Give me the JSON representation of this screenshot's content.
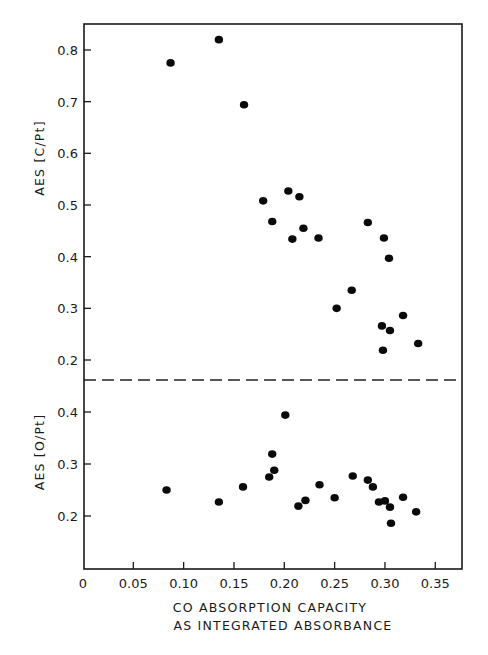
{
  "chart_data": {
    "type": "scatter",
    "layout": "two stacked panels sharing x-axis, separated by a dashed horizontal line",
    "grid": false,
    "legend": null,
    "x_axis": {
      "label_line1": "CO ABSORPTION CAPACITY",
      "label_line2": "AS INTEGRATED ABSORBANCE",
      "xlim": [
        0,
        0.378
      ],
      "ticks": [
        0,
        0.05,
        0.1,
        0.15,
        0.2,
        0.25,
        0.3,
        0.35
      ],
      "tick_labels": [
        "0",
        "0.05",
        "0.10",
        "0.15",
        "0.20",
        "0.25",
        "0.30",
        "0.35"
      ]
    },
    "panels": [
      {
        "name": "upper",
        "ylabel": "AES [C/Pt]",
        "ylim": [
          0.16,
          0.85
        ],
        "ticks": [
          0.2,
          0.3,
          0.4,
          0.5,
          0.6,
          0.7,
          0.8
        ],
        "tick_labels": [
          "0.2",
          "0.3",
          "0.4",
          "0.5",
          "0.6",
          "0.7",
          "0.8"
        ],
        "points": [
          [
            0.087,
            0.775
          ],
          [
            0.135,
            0.82
          ],
          [
            0.16,
            0.694
          ],
          [
            0.179,
            0.508
          ],
          [
            0.188,
            0.468
          ],
          [
            0.204,
            0.527
          ],
          [
            0.208,
            0.434
          ],
          [
            0.215,
            0.516
          ],
          [
            0.219,
            0.455
          ],
          [
            0.234,
            0.436
          ],
          [
            0.252,
            0.3
          ],
          [
            0.267,
            0.335
          ],
          [
            0.283,
            0.466
          ],
          [
            0.297,
            0.266
          ],
          [
            0.298,
            0.219
          ],
          [
            0.299,
            0.436
          ],
          [
            0.304,
            0.397
          ],
          [
            0.305,
            0.257
          ],
          [
            0.318,
            0.286
          ],
          [
            0.333,
            0.232
          ]
        ]
      },
      {
        "name": "lower",
        "ylabel": "AES [O/Pt]",
        "ylim": [
          0.1,
          0.45
        ],
        "ticks": [
          0.2,
          0.3,
          0.4
        ],
        "tick_labels": [
          "0.2",
          "0.3",
          "0.4"
        ],
        "points": [
          [
            0.083,
            0.25
          ],
          [
            0.135,
            0.227
          ],
          [
            0.159,
            0.256
          ],
          [
            0.185,
            0.275
          ],
          [
            0.188,
            0.319
          ],
          [
            0.19,
            0.288
          ],
          [
            0.201,
            0.394
          ],
          [
            0.214,
            0.219
          ],
          [
            0.221,
            0.23
          ],
          [
            0.235,
            0.26
          ],
          [
            0.25,
            0.235
          ],
          [
            0.268,
            0.277
          ],
          [
            0.283,
            0.269
          ],
          [
            0.288,
            0.256
          ],
          [
            0.294,
            0.227
          ],
          [
            0.3,
            0.229
          ],
          [
            0.305,
            0.217
          ],
          [
            0.306,
            0.186
          ],
          [
            0.318,
            0.236
          ],
          [
            0.331,
            0.208
          ]
        ]
      }
    ],
    "divider": {
      "style": "dashed",
      "color": "#222222"
    },
    "colors": {
      "frame": "#1a1a1a",
      "marker": "#0a0a0a",
      "background": "#ffffff"
    }
  }
}
